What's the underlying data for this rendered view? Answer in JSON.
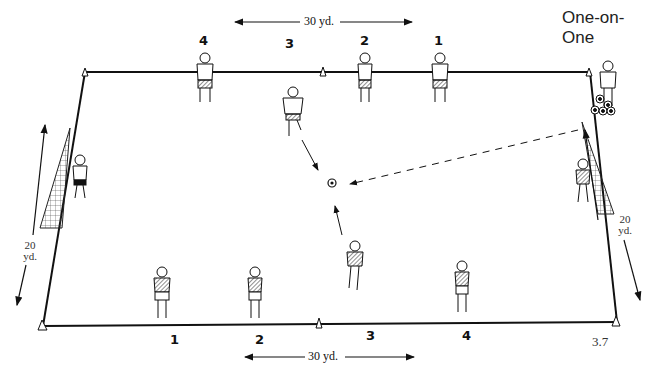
{
  "title": "One-on-One",
  "figure_number": "3.7",
  "dimensions": {
    "top_width": "30 yd.",
    "bottom_width": "30 yd.",
    "left_length": "20 yd.",
    "right_length": "20 yd."
  },
  "top_team": {
    "player_numbers": [
      "4",
      "3",
      "2",
      "1"
    ]
  },
  "bottom_team": {
    "player_numbers": [
      "1",
      "2",
      "3",
      "4"
    ]
  },
  "left_dim": {
    "value": "20",
    "unit": "yd."
  },
  "right_dim": {
    "value": "20",
    "unit": "yd."
  },
  "colors": {
    "line": "#111111",
    "background": "#ffffff"
  }
}
